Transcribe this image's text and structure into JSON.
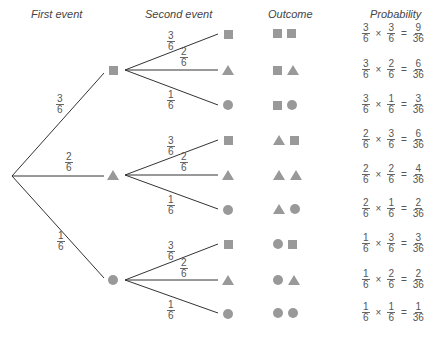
{
  "headers": {
    "first_event": "First event",
    "second_event": "Second event",
    "outcome": "Outcome",
    "probability": "Probability"
  },
  "colors": {
    "line": "#333333",
    "shape": "#999999",
    "text": "#555555"
  },
  "first_branches": [
    {
      "shape": "square",
      "num": "3",
      "den": "6"
    },
    {
      "shape": "triangle",
      "num": "2",
      "den": "6"
    },
    {
      "shape": "circle",
      "num": "1",
      "den": "6"
    }
  ],
  "second_branches": [
    {
      "shape": "square",
      "num": "3",
      "den": "6"
    },
    {
      "shape": "triangle",
      "num": "2",
      "den": "6"
    },
    {
      "shape": "circle",
      "num": "1",
      "den": "6"
    }
  ],
  "rows": [
    {
      "outcome": [
        "square",
        "square"
      ],
      "p1": {
        "num": "3",
        "den": "6"
      },
      "p2": {
        "num": "3",
        "den": "6"
      },
      "result": {
        "num": "9",
        "den": "36"
      }
    },
    {
      "outcome": [
        "square",
        "triangle"
      ],
      "p1": {
        "num": "3",
        "den": "6"
      },
      "p2": {
        "num": "2",
        "den": "6"
      },
      "result": {
        "num": "6",
        "den": "36"
      }
    },
    {
      "outcome": [
        "square",
        "circle"
      ],
      "p1": {
        "num": "3",
        "den": "6"
      },
      "p2": {
        "num": "1",
        "den": "6"
      },
      "result": {
        "num": "3",
        "den": "36"
      }
    },
    {
      "outcome": [
        "triangle",
        "square"
      ],
      "p1": {
        "num": "2",
        "den": "6"
      },
      "p2": {
        "num": "3",
        "den": "6"
      },
      "result": {
        "num": "6",
        "den": "36"
      }
    },
    {
      "outcome": [
        "triangle",
        "triangle"
      ],
      "p1": {
        "num": "2",
        "den": "6"
      },
      "p2": {
        "num": "2",
        "den": "6"
      },
      "result": {
        "num": "4",
        "den": "36"
      }
    },
    {
      "outcome": [
        "triangle",
        "circle"
      ],
      "p1": {
        "num": "2",
        "den": "6"
      },
      "p2": {
        "num": "1",
        "den": "6"
      },
      "result": {
        "num": "2",
        "den": "36"
      }
    },
    {
      "outcome": [
        "circle",
        "square"
      ],
      "p1": {
        "num": "1",
        "den": "6"
      },
      "p2": {
        "num": "3",
        "den": "6"
      },
      "result": {
        "num": "3",
        "den": "36"
      }
    },
    {
      "outcome": [
        "circle",
        "triangle"
      ],
      "p1": {
        "num": "1",
        "den": "6"
      },
      "p2": {
        "num": "2",
        "den": "6"
      },
      "result": {
        "num": "2",
        "den": "36"
      }
    },
    {
      "outcome": [
        "circle",
        "circle"
      ],
      "p1": {
        "num": "1",
        "den": "6"
      },
      "p2": {
        "num": "1",
        "den": "6"
      },
      "result": {
        "num": "1",
        "den": "36"
      }
    }
  ],
  "operators": {
    "times": "×",
    "equals": "="
  }
}
